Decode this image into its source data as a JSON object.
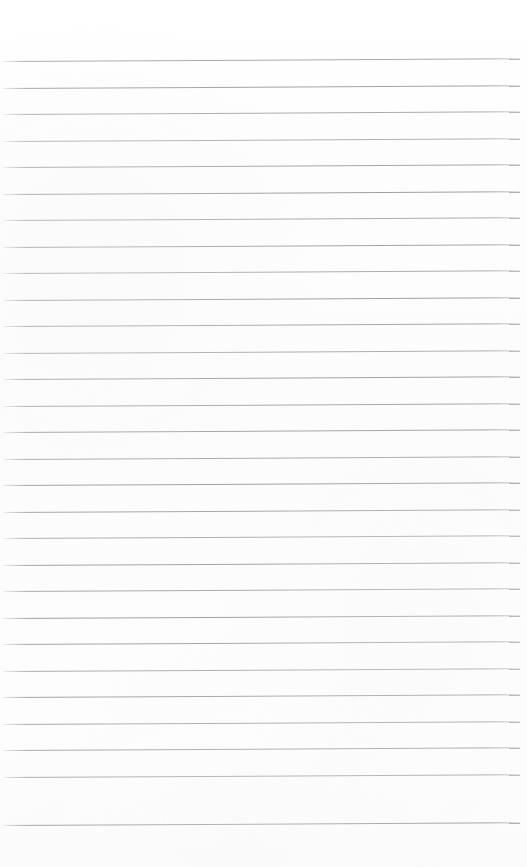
{
  "document": {
    "kind": "lined-paper-scan",
    "title": "Blank Ruled Notebook Page",
    "page_width": 527,
    "page_height": 867,
    "paper_color": "#fdfdfd",
    "background_color": "#ffffff",
    "has_text_content": false,
    "has_vertical_margin_rule": false,
    "text_content": ""
  },
  "ruling": {
    "line_color": "#8a8a8f",
    "line_thickness_px": 1,
    "line_count": 29,
    "first_line_y": 61,
    "last_line_y": 825,
    "line_spacing_px": 26.6,
    "line_start_x": 3,
    "line_end_x": 520,
    "skew_degrees": -0.3,
    "top_margin_px": 61,
    "bottom_margin_px": 42,
    "left_margin_px": 3,
    "right_margin_px": 7,
    "lines": [
      {
        "index": 1,
        "y": 61,
        "opacity": 0.72
      },
      {
        "index": 2,
        "y": 88,
        "opacity": 0.78
      },
      {
        "index": 3,
        "y": 114,
        "opacity": 0.7
      },
      {
        "index": 4,
        "y": 141,
        "opacity": 0.66
      },
      {
        "index": 5,
        "y": 167,
        "opacity": 0.74
      },
      {
        "index": 6,
        "y": 194,
        "opacity": 0.8
      },
      {
        "index": 7,
        "y": 220,
        "opacity": 0.71
      },
      {
        "index": 8,
        "y": 247,
        "opacity": 0.76
      },
      {
        "index": 9,
        "y": 273,
        "opacity": 0.69
      },
      {
        "index": 10,
        "y": 300,
        "opacity": 0.79
      },
      {
        "index": 11,
        "y": 326,
        "opacity": 0.73
      },
      {
        "index": 12,
        "y": 353,
        "opacity": 0.68
      },
      {
        "index": 13,
        "y": 379,
        "opacity": 0.77
      },
      {
        "index": 14,
        "y": 406,
        "opacity": 0.72
      },
      {
        "index": 15,
        "y": 432,
        "opacity": 0.75
      },
      {
        "index": 16,
        "y": 459,
        "opacity": 0.7
      },
      {
        "index": 17,
        "y": 485,
        "opacity": 0.78
      },
      {
        "index": 18,
        "y": 512,
        "opacity": 0.73
      },
      {
        "index": 19,
        "y": 538,
        "opacity": 0.67
      },
      {
        "index": 20,
        "y": 565,
        "opacity": 0.76
      },
      {
        "index": 21,
        "y": 591,
        "opacity": 0.71
      },
      {
        "index": 22,
        "y": 618,
        "opacity": 0.79
      },
      {
        "index": 23,
        "y": 644,
        "opacity": 0.74
      },
      {
        "index": 24,
        "y": 671,
        "opacity": 0.69
      },
      {
        "index": 25,
        "y": 697,
        "opacity": 0.77
      },
      {
        "index": 26,
        "y": 724,
        "opacity": 0.72
      },
      {
        "index": 27,
        "y": 750,
        "opacity": 0.75
      },
      {
        "index": 28,
        "y": 777,
        "opacity": 0.7
      },
      {
        "index": 29,
        "y": 825,
        "opacity": 0.78
      }
    ]
  }
}
